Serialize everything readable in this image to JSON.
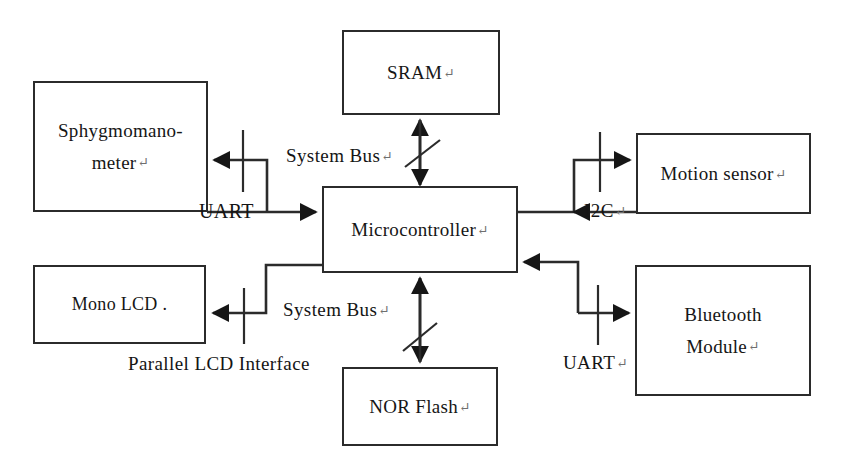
{
  "diagram": {
    "stroke_color": "#2b2b2b",
    "text_color": "#161616",
    "background": "#ffffff",
    "cr_glyph": "↵",
    "nodes": [
      {
        "id": "sphygmomanometer",
        "lines": [
          "Sphygmomano-",
          "meter"
        ],
        "has_cr": true,
        "x": 33,
        "y": 81,
        "w": 175,
        "h": 131
      },
      {
        "id": "mono-lcd",
        "lines": [
          "Mono LCD ."
        ],
        "has_cr": false,
        "x": 33,
        "y": 265,
        "w": 173,
        "h": 79
      },
      {
        "id": "sram",
        "lines": [
          "SRAM"
        ],
        "has_cr": true,
        "x": 342,
        "y": 30,
        "w": 158,
        "h": 85
      },
      {
        "id": "microcontroller",
        "lines": [
          "Microcontroller"
        ],
        "has_cr": true,
        "x": 322,
        "y": 186,
        "w": 196,
        "h": 87
      },
      {
        "id": "nor-flash",
        "lines": [
          "NOR Flash"
        ],
        "has_cr": true,
        "x": 342,
        "y": 367,
        "w": 156,
        "h": 79
      },
      {
        "id": "motion-sensor",
        "lines": [
          "Motion sensor"
        ],
        "has_cr": true,
        "x": 636,
        "y": 133,
        "w": 175,
        "h": 81
      },
      {
        "id": "bluetooth",
        "lines": [
          "Bluetooth",
          "Module"
        ],
        "has_cr": true,
        "x": 635,
        "y": 265,
        "w": 176,
        "h": 131
      }
    ],
    "edge_labels": [
      {
        "id": "uart-left",
        "text": "UART",
        "has_cr": false,
        "connects": "sphygmomanometer <-> microcontroller"
      },
      {
        "id": "system-bus-top",
        "text": "System Bus",
        "has_cr": true,
        "connects": "sram <-> microcontroller"
      },
      {
        "id": "system-bus-bot",
        "text": "System Bus",
        "has_cr": true,
        "connects": "nor-flash <-> microcontroller"
      },
      {
        "id": "i2c",
        "text": "I2C",
        "has_cr": true,
        "connects": "motion-sensor <-> microcontroller"
      },
      {
        "id": "uart-right",
        "text": "UART",
        "has_cr": true,
        "connects": "bluetooth <-> microcontroller"
      },
      {
        "id": "parallel-lcd",
        "text": "Parallel LCD Interface",
        "has_cr": false,
        "connects": "mono-lcd <-> microcontroller"
      }
    ]
  }
}
